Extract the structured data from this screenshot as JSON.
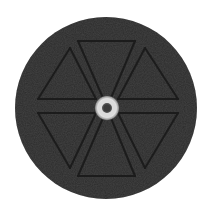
{
  "image": {
    "description": "Dark circular disc with a faint hexagram line pattern and a bright ring at the center",
    "colors": {
      "background": "#ffffff",
      "disc": "#2b2b2b",
      "lines": "#161616",
      "ring": "#d9d9d9",
      "ring_center": "#3a3a3a"
    },
    "disc": {
      "cx": 106,
      "cy": 108,
      "r": 91
    },
    "ring": {
      "cx": 107,
      "cy": 108,
      "outer_r": 9,
      "inner_r": 4.5
    }
  }
}
